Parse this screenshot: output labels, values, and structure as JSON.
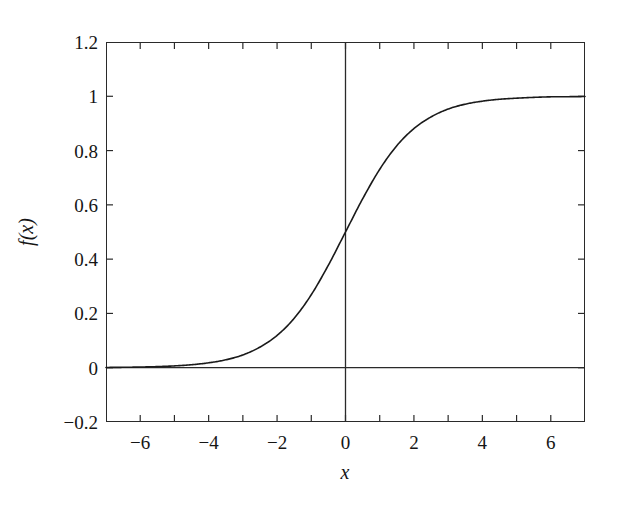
{
  "chart_data": {
    "type": "line",
    "title": "",
    "xlabel": "x",
    "ylabel": "f(x)",
    "xlim": [
      -7,
      7
    ],
    "ylim": [
      -0.2,
      1.2
    ],
    "grid": false,
    "legend": null,
    "series": [
      {
        "name": "logistic sigmoid",
        "formula": "f(x) = 1 / (1 + e^(-x))",
        "color": "#1a1a1a",
        "x": [
          -7,
          -6.5,
          -6,
          -5.5,
          -5,
          -4.5,
          -4,
          -3.5,
          -3,
          -2.5,
          -2,
          -1.5,
          -1,
          -0.5,
          0,
          0.5,
          1,
          1.5,
          2,
          2.5,
          3,
          3.5,
          4,
          4.5,
          5,
          5.5,
          6,
          6.5,
          7
        ],
        "values": [
          0.001,
          0.0015,
          0.0025,
          0.0041,
          0.0067,
          0.011,
          0.018,
          0.029,
          0.047,
          0.076,
          0.119,
          0.182,
          0.269,
          0.378,
          0.5,
          0.622,
          0.731,
          0.818,
          0.881,
          0.924,
          0.953,
          0.971,
          0.982,
          0.989,
          0.993,
          0.996,
          0.998,
          0.9985,
          0.999
        ]
      }
    ],
    "reference_lines": [
      {
        "name": "y-axis",
        "orientation": "vertical",
        "value": 0
      },
      {
        "name": "x-axis",
        "orientation": "horizontal",
        "value": 0
      }
    ],
    "x_ticks": [
      {
        "value": -6,
        "label": "−6"
      },
      {
        "value": -4,
        "label": "−4"
      },
      {
        "value": -2,
        "label": "−2"
      },
      {
        "value": 0,
        "label": "0"
      },
      {
        "value": 2,
        "label": "2"
      },
      {
        "value": 4,
        "label": "4"
      },
      {
        "value": 6,
        "label": "6"
      }
    ],
    "x_minor_ticks": [
      -7,
      -5,
      -3,
      -1,
      1,
      3,
      5,
      7
    ],
    "y_ticks": [
      {
        "value": 1.2,
        "label": "1.2"
      },
      {
        "value": 1,
        "label": "1"
      },
      {
        "value": 0.8,
        "label": "0.8"
      },
      {
        "value": 0.6,
        "label": "0.6"
      },
      {
        "value": 0.4,
        "label": "0.4"
      },
      {
        "value": 0.2,
        "label": "0.2"
      },
      {
        "value": 0,
        "label": "0"
      },
      {
        "value": -0.2,
        "label": "−0.2"
      }
    ]
  },
  "style": {
    "axis_color": "#2a2a2a",
    "curve_color": "#1a1a1a",
    "text_color": "#151515",
    "background": "#ffffff"
  }
}
